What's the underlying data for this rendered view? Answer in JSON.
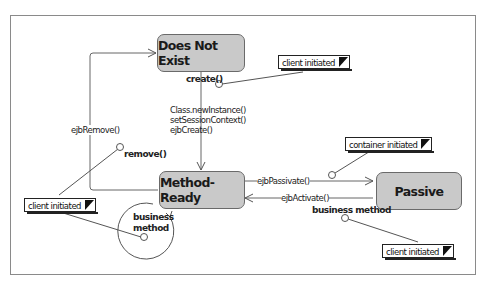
{
  "states": {
    "does_not_exist": "Does Not  Exist",
    "method_ready": "Method-Ready",
    "passive": "Passive"
  },
  "transitions": {
    "create_calls": [
      "Class.newInstance()",
      "setSessionContext()",
      "ejbCreate()"
    ],
    "ejb_remove": "ejbRemove()",
    "ejb_passivate": "ejbPassivate()",
    "ejb_activate": "ejbActivate()"
  },
  "events": {
    "create": "create()",
    "remove": "remove()",
    "business_method_loop": [
      "business",
      "method"
    ],
    "business_method_passive": "business method"
  },
  "notes": {
    "create_note": "client initiated",
    "remove_note": "client initiated",
    "passivate_note": "container initiated",
    "passive_business_note": "client initiated"
  }
}
